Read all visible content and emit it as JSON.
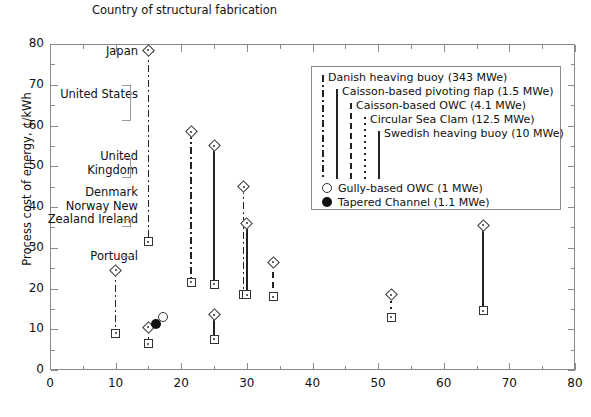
{
  "header_note": "Country of\nstructural\nfabrication",
  "axes": {
    "ylabel": "Process cost of energy, ¢/kWh",
    "xlabel": "",
    "ylim": [
      0,
      80
    ],
    "xlim": [
      0,
      80
    ],
    "yticks": [
      "0",
      "10",
      "20",
      "30",
      "40",
      "50",
      "60",
      "70",
      "80"
    ],
    "xticks": [
      "0",
      "10",
      "20",
      "30",
      "40",
      "50",
      "60",
      "70",
      "80"
    ]
  },
  "country_labels": [
    {
      "text": "Japan",
      "value_hint": "78.5"
    },
    {
      "text": "United\nStates",
      "value_hint": "61-70"
    },
    {
      "text": "United\nKingdom",
      "value_hint": "47-52"
    },
    {
      "text": "Denmark\nNorway\nNew Zealand\nIreland",
      "value_hint": "35-45"
    },
    {
      "text": "Portugal",
      "value_hint": "31.5"
    }
  ],
  "legend": {
    "line_entries": [
      {
        "label": "Danish heaving buoy (343 MWe)",
        "style": "dashdot"
      },
      {
        "label": "Caisson-based pivoting flap (1.5 MWe)",
        "style": "solid"
      },
      {
        "label": "Caisson-based OWC (4.1 MWe)",
        "style": "longdash"
      },
      {
        "label": "Circular Sea Clam (12.5 MWe)",
        "style": "dotted"
      },
      {
        "label": "Swedish heaving buoy (10 MWe)",
        "style": "solid-thick"
      }
    ],
    "marker_entries": [
      {
        "label": "Gully-based OWC (1 MWe)",
        "marker": "open-circle"
      },
      {
        "label": "Tapered Channel (1.1 MWe)",
        "marker": "filled-circle"
      }
    ]
  },
  "chart_data": {
    "type": "scatter",
    "title": "",
    "xlabel": "",
    "ylabel": "Process cost of energy, ¢/kWh",
    "xlim": [
      0,
      80
    ],
    "ylim": [
      0,
      80
    ],
    "grid": false,
    "legend_position": "upper-right",
    "note": "Each series is a vertical range bar: open diamond marks the high value, open square marks the low value.",
    "series": [
      {
        "name": "Danish heaving buoy (343 MWe)",
        "power_MWe": 343,
        "style": "dashdot",
        "points": [
          {
            "x": 15,
            "high": 78.5,
            "low": 31.5
          },
          {
            "x": 21.5,
            "high": 58.5,
            "low": 21.5
          },
          {
            "x": 29.5,
            "high": 45.0,
            "low": 18.5
          },
          {
            "x": 10,
            "high": 24.5,
            "low": 9.0
          },
          {
            "x": 15,
            "high": 10.5,
            "low": 6.5
          }
        ]
      },
      {
        "name": "Caisson-based pivoting flap (1.5 MWe)",
        "power_MWe": 1.5,
        "style": "solid",
        "points": [
          {
            "x": 25,
            "high": 55.0,
            "low": 21.0
          },
          {
            "x": 30,
            "high": 36.0,
            "low": 18.5
          },
          {
            "x": 25,
            "high": 13.5,
            "low": 7.5
          },
          {
            "x": 66,
            "high": 35.5,
            "low": 14.5
          }
        ]
      },
      {
        "name": "Caisson-based OWC (4.1 MWe)",
        "power_MWe": 4.1,
        "style": "longdash",
        "points": [
          {
            "x": 34,
            "high": 26.5,
            "low": 18.0
          }
        ]
      },
      {
        "name": "Circular Sea Clam (12.5 MWe)",
        "power_MWe": 12.5,
        "style": "dotted",
        "points": [
          {
            "x": 52,
            "high": 18.5,
            "low": 13.0
          }
        ]
      },
      {
        "name": "Swedish heaving buoy (10 MWe)",
        "power_MWe": 10,
        "style": "solid-thick",
        "points": []
      }
    ],
    "single_markers": [
      {
        "name": "Gully-based OWC (1 MWe)",
        "marker": "open-circle",
        "x": 17.2,
        "y": 12.9
      },
      {
        "name": "Tapered Channel (1.1 MWe)",
        "marker": "filled-circle",
        "x": 16.1,
        "y": 11.3
      }
    ]
  }
}
